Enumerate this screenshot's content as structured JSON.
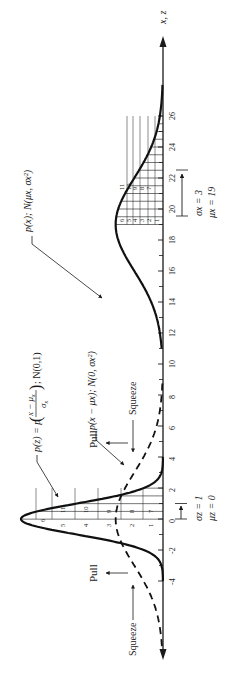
{
  "figure": {
    "axis_label": "x, z",
    "ticks": [
      "-4",
      "-2",
      "0",
      "2",
      "4",
      "6",
      "8",
      "10",
      "12",
      "14",
      "16",
      "18",
      "20",
      "22",
      "24",
      "26"
    ],
    "tick_values": [
      -4,
      -2,
      0,
      2,
      4,
      6,
      8,
      10,
      12,
      14,
      16,
      18,
      20,
      22,
      24,
      26
    ],
    "standard": {
      "label": "p(z) = p((x − μx)/σx); N(0,1)",
      "label_parts": {
        "lhs": "p(z) = p",
        "num": "x − μ",
        "num_sub": "x",
        "den": "σ",
        "den_sub": "x",
        "rhs": "; N(0,1)"
      },
      "mu_label": "μz = 0",
      "sigma_label": "σz = 1",
      "mu": 0,
      "sigma": 1,
      "grid_labels": [
        "6",
        "5",
        "11",
        "4",
        "10",
        "3",
        "9",
        "2",
        "8",
        "1",
        "7"
      ]
    },
    "centered": {
      "label": "p(x − μx); N(0, σx²)",
      "mu": 0,
      "sigma": 3
    },
    "original": {
      "label": "p(x); N(μx, σx²)",
      "mu_label": "μx = 19",
      "sigma_label": "σx = 3",
      "mu": 19,
      "sigma": 3,
      "grid_labels": [
        "6",
        "5",
        "4",
        "3",
        "2",
        "1",
        "11",
        "10",
        "9",
        "8",
        "7"
      ]
    },
    "annotations": {
      "pull_label": "Pull",
      "squeeze_label": "Squeeze"
    }
  }
}
